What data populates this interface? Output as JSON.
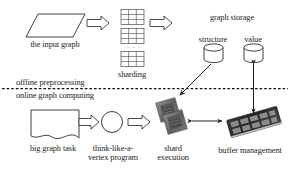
{
  "figure": {
    "type": "system-architecture-flowchart",
    "title": "",
    "phases": [
      {
        "id": "offline",
        "label": "offline preprocessing"
      },
      {
        "id": "online",
        "label": "online graph computing"
      }
    ],
    "nodes": [
      {
        "id": "input-graph",
        "label": "the input graph",
        "shape": "parallelogram",
        "row": "offline"
      },
      {
        "id": "sharding",
        "label": "sharding",
        "shape": "grid-stack",
        "row": "offline"
      },
      {
        "id": "graph-storage",
        "label": "graph storage",
        "shape": "group-title",
        "row": "offline"
      },
      {
        "id": "structure-store",
        "label": "structure",
        "shape": "cylinder",
        "row": "offline"
      },
      {
        "id": "value-store",
        "label": "value",
        "shape": "cylinder",
        "row": "offline"
      },
      {
        "id": "big-graph-task",
        "label": "big graph task",
        "shape": "document",
        "row": "online"
      },
      {
        "id": "vertex-program",
        "label": "think-like-a-vertex program",
        "shape": "circle",
        "row": "online"
      },
      {
        "id": "shard-execution",
        "label": "shard execution",
        "shape": "cpu-chips",
        "row": "online"
      },
      {
        "id": "buffer-management",
        "label": "buffer management",
        "shape": "memory-module",
        "row": "online"
      }
    ],
    "edges": [
      {
        "from": "input-graph",
        "to": "sharding",
        "style": "block-arrow",
        "direction": "right"
      },
      {
        "from": "sharding",
        "to": "graph-storage",
        "style": "block-arrow",
        "direction": "right"
      },
      {
        "from": "big-graph-task",
        "to": "vertex-program",
        "style": "block-arrow",
        "direction": "right"
      },
      {
        "from": "vertex-program",
        "to": "shard-execution",
        "style": "block-arrow",
        "direction": "right"
      },
      {
        "from": "structure-store",
        "to": "shard-execution",
        "style": "thin-arrow",
        "direction": "diagonal-down-left"
      },
      {
        "from": "shard-execution",
        "to": "buffer-management",
        "style": "thin-arrow",
        "direction": "bidirectional"
      },
      {
        "from": "value-store",
        "to": "buffer-management",
        "style": "thin-arrow",
        "direction": "bidirectional-vertical"
      }
    ],
    "divider": {
      "style": "dashed",
      "orientation": "horizontal"
    },
    "sharding_detail": {
      "tables": 3,
      "ellipsis": "· · ·",
      "columns": 3,
      "rows": 3
    },
    "colors": {
      "background": "#ffffff",
      "stroke": "#2b2b2b",
      "text": "#1c1c1c",
      "chip": "#6f6f6f",
      "memory": "#2e2e2e"
    }
  }
}
